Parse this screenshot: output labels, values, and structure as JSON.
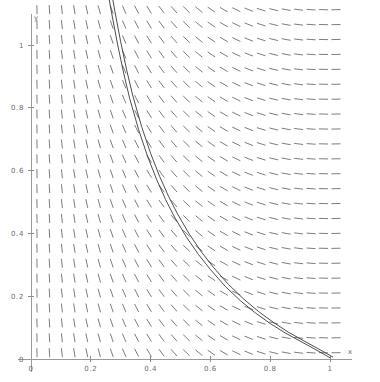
{
  "figure": {
    "kind": "slope-field-with-solution-curves",
    "background_color": "#ffffff",
    "axis_color": "#9a9a9a",
    "slope_color": "#7d7d7d",
    "curve_color": "#3a3a3a"
  },
  "axes": {
    "x_label": "x",
    "y_label": "y",
    "x_ticks": [
      {
        "value": 0,
        "label": "0"
      },
      {
        "value": 0.2,
        "label": "0.2"
      },
      {
        "value": 0.4,
        "label": "0.4"
      },
      {
        "value": 0.6,
        "label": "0.6"
      },
      {
        "value": 0.8,
        "label": "0.8"
      },
      {
        "value": 1,
        "label": "1"
      }
    ],
    "y_ticks": [
      {
        "value": 0,
        "label": "0"
      },
      {
        "value": 0.2,
        "label": "0.2"
      },
      {
        "value": 0.4,
        "label": "0.4"
      },
      {
        "value": 0.6,
        "label": "0.6"
      },
      {
        "value": 0.8,
        "label": "0.8"
      },
      {
        "value": 1,
        "label": "1"
      }
    ],
    "x_origin_label": "0",
    "y_origin_label": "0"
  },
  "chart_data": {
    "type": "line",
    "title": "",
    "xlabel": "x",
    "ylabel": "y",
    "xlim": [
      0,
      1.06
    ],
    "ylim": [
      0,
      1.18
    ],
    "grid": false,
    "legend": "none",
    "xticks": [
      0,
      0.2,
      0.4,
      0.6,
      0.8,
      1
    ],
    "xticklabels": [
      "0",
      "0.2",
      "0.4",
      "0.6",
      "0.8",
      "1"
    ],
    "yticks": [
      0,
      0.2,
      0.4,
      0.6,
      0.8,
      1
    ],
    "yticklabels": [
      "0",
      "0.2",
      "0.4",
      "0.6",
      "0.8",
      "1"
    ],
    "slope_field": {
      "description": "direction field, segments nearly vertical near x=0 and flattening toward horizontal near x=1",
      "x_start": 0.02,
      "x_end": 1.02,
      "y_start": 0.02,
      "y_end": 1.16,
      "n_cols": 25,
      "n_rows": 25,
      "segment_length_px": 9,
      "slope_rule": "dy/dx = -(1-x)/x  (steep/vertical at small x, shallow at x near 1)"
    },
    "series": [
      {
        "name": "solution-curve-1",
        "x": [
          0.255,
          0.27,
          0.29,
          0.31,
          0.33,
          0.36,
          0.39,
          0.42,
          0.45,
          0.48,
          0.52,
          0.56,
          0.6,
          0.65,
          0.7,
          0.75,
          0.8,
          0.85,
          0.9,
          0.95,
          1.0
        ],
        "y": [
          1.18,
          1.1,
          1.0,
          0.91,
          0.83,
          0.73,
          0.645,
          0.572,
          0.508,
          0.452,
          0.388,
          0.333,
          0.285,
          0.231,
          0.186,
          0.147,
          0.113,
          0.083,
          0.057,
          0.031,
          0.004
        ]
      },
      {
        "name": "solution-curve-2",
        "x": [
          0.267,
          0.28,
          0.3,
          0.32,
          0.34,
          0.37,
          0.4,
          0.43,
          0.46,
          0.49,
          0.53,
          0.57,
          0.61,
          0.66,
          0.71,
          0.76,
          0.81,
          0.86,
          0.91,
          0.96,
          1.01
        ],
        "y": [
          1.18,
          1.11,
          1.01,
          0.92,
          0.84,
          0.74,
          0.655,
          0.582,
          0.518,
          0.462,
          0.397,
          0.341,
          0.292,
          0.238,
          0.192,
          0.152,
          0.117,
          0.086,
          0.059,
          0.033,
          0.006
        ]
      }
    ]
  }
}
